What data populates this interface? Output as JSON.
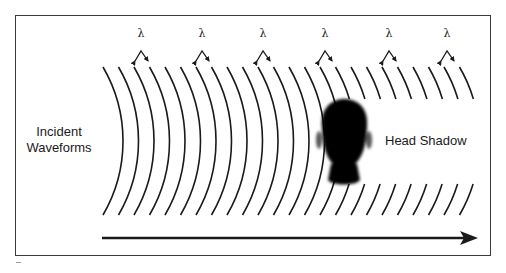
{
  "labels": {
    "incident": "Incident",
    "incident_line2": "Waveforms",
    "head_shadow": "Head Shadow",
    "wavelength_symbol": "λ"
  },
  "colors": {
    "line": "#1a1a1a",
    "frame": "#3a3a3a",
    "head": "#000000",
    "background": "#ffffff"
  },
  "diagram": {
    "frame": {
      "x": 15,
      "y": 15,
      "w": 476,
      "h": 241
    },
    "arcs": {
      "count": 24,
      "start_x": 103,
      "spacing": 15.5,
      "top_y": 67,
      "bottom_y": 215,
      "bulge": 20,
      "full_arcs": 15,
      "truncated_top_end_y": 99,
      "truncated_bottom_start_y": 184
    },
    "wavelength_markers_x": [
      141,
      202,
      263,
      325,
      389,
      447
    ],
    "arrow": {
      "x1": 102,
      "x2": 478,
      "y": 238
    },
    "head": {
      "cx": 344,
      "top_y": 100,
      "chin_y": 170,
      "neck_bottom_y": 186
    }
  }
}
